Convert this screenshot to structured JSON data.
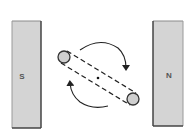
{
  "diagram": {
    "magnets": [
      {
        "id": "south",
        "label": "S",
        "fill": "#d4d4d4",
        "stroke": "#555555"
      },
      {
        "id": "north",
        "label": "N",
        "fill": "#d4d4d4",
        "stroke": "#555555"
      }
    ],
    "coil": {
      "ends": [
        "upper-left",
        "lower-right"
      ],
      "end_fill": "#cfcfcf",
      "line_style": "dashed",
      "axis_dot": true
    },
    "rotation_arrows": [
      {
        "id": "top-arrow",
        "direction": "clockwise"
      },
      {
        "id": "bottom-arrow",
        "direction": "clockwise"
      }
    ],
    "colors": {
      "background": "#ffffff",
      "line": "#222222",
      "magnet_fill": "#d4d4d4",
      "magnet_edge": "#555555"
    }
  }
}
